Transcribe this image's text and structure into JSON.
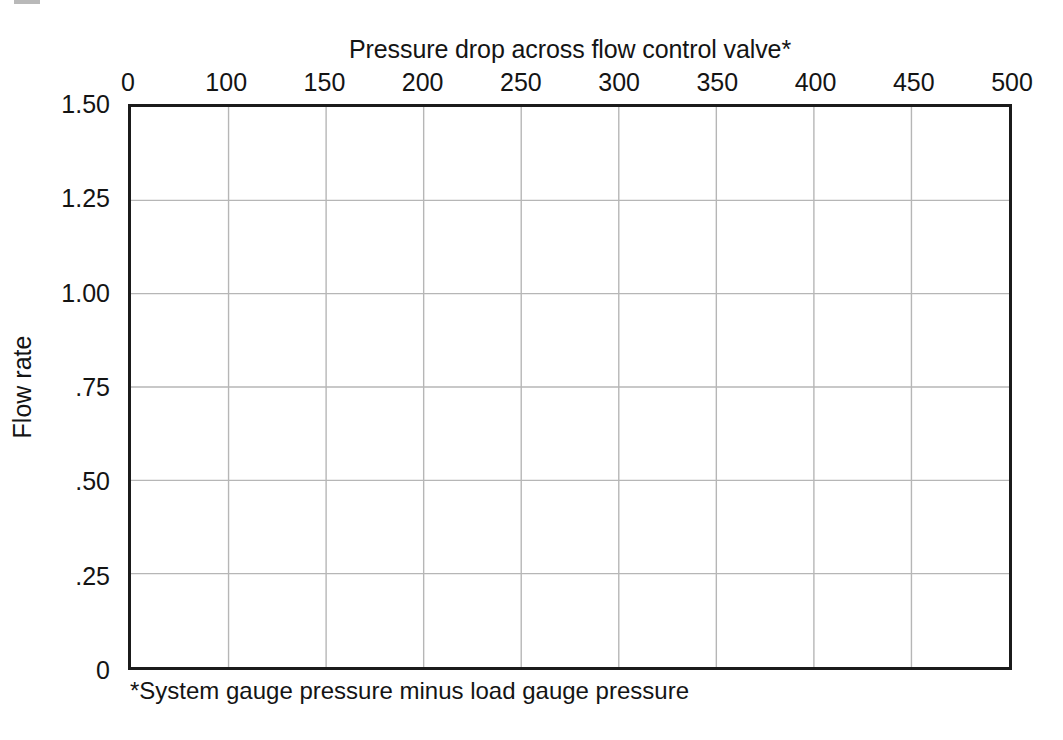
{
  "page": {
    "background": "#ffffff",
    "text_color": "#141414"
  },
  "chart_data": {
    "type": "line",
    "title": "Pressure drop across flow control valve*",
    "subtitle": "",
    "xlabel": "Pressure drop across flow control valve*",
    "ylabel": "Flow rate",
    "footnote": "*System gauge pressure minus load gauge pressure",
    "x_tick_labels": [
      "0",
      "100",
      "150",
      "200",
      "250",
      "300",
      "350",
      "400",
      "450",
      "500"
    ],
    "x_tick_values": [
      0,
      100,
      150,
      200,
      250,
      300,
      350,
      400,
      450,
      500
    ],
    "y_tick_labels": [
      "1.50",
      "1.25",
      "1.00",
      ".75",
      ".50",
      ".25",
      "0"
    ],
    "y_tick_values": [
      1.5,
      1.25,
      1.0,
      0.75,
      0.5,
      0.25,
      0
    ],
    "xlim": [
      0,
      500
    ],
    "ylim": [
      0,
      1.5
    ],
    "x_axis_position": "top",
    "y_axis_position": "left",
    "grid": true,
    "grid_color": "#b6b6b6",
    "border_color": "#1b1b1b",
    "legend": null,
    "series": [],
    "values": [],
    "categories": [],
    "annotations": [],
    "note": "Blank plotting grid worksheet; no data series are drawn inside the axes."
  },
  "axes": {
    "x_tick_count": 10,
    "y_tick_count": 7,
    "vertical_gridlines": 9,
    "horizontal_gridlines": 5
  }
}
